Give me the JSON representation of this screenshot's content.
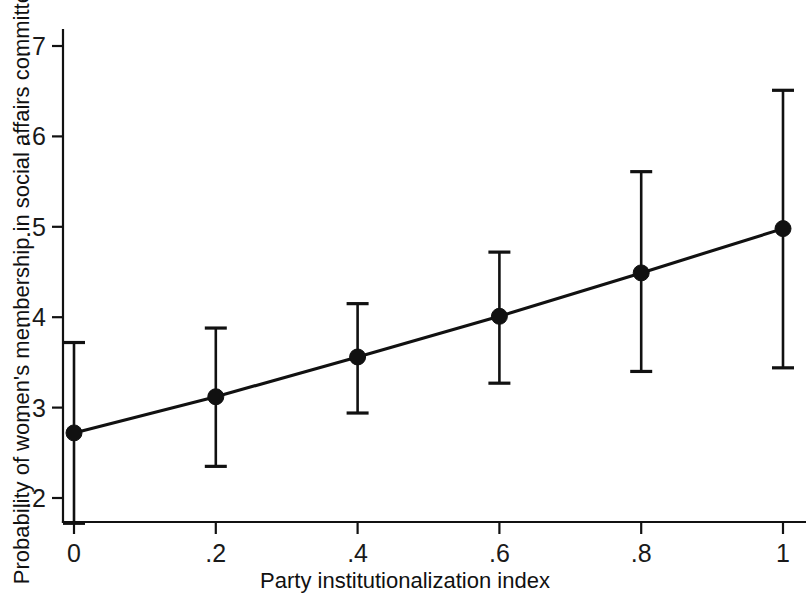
{
  "chart_data": {
    "type": "line",
    "title": "",
    "subtitle": "",
    "xlabel": "Party institutionalization index",
    "ylabel": "Probability of women's membership in social affairs committees",
    "x": [
      0,
      0.2,
      0.4,
      0.6,
      0.8,
      1
    ],
    "xticklabels": [
      "0",
      ".2",
      ".4",
      ".6",
      ".8",
      "1"
    ],
    "yticks": [
      0.2,
      0.3,
      0.4,
      0.5,
      0.6,
      0.7
    ],
    "yticklabels": [
      ".2",
      ".3",
      ".4",
      ".5",
      ".6",
      ".7"
    ],
    "xlim": [
      -0.04,
      1.04
    ],
    "ylim": [
      0.155,
      0.715
    ],
    "grid": false,
    "legend": null,
    "series": [
      {
        "name": "Predicted probability",
        "marker": "filled-circle",
        "values": [
          0.272,
          0.312,
          0.356,
          0.401,
          0.449,
          0.498
        ],
        "ci_lower": [
          0.172,
          0.235,
          0.294,
          0.327,
          0.34,
          0.344
        ],
        "ci_upper": [
          0.372,
          0.388,
          0.415,
          0.472,
          0.561,
          0.651
        ]
      }
    ]
  },
  "axes": {
    "y_axis_name": "y-axis",
    "x_axis_name": "x-axis"
  }
}
